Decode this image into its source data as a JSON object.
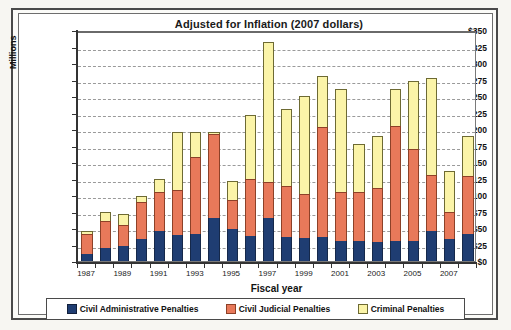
{
  "chart_data": {
    "type": "bar",
    "stacked": true,
    "title": "Adjusted for Inflation  (2007 dollars)",
    "xlabel": "Fiscal year",
    "ylabel": "Millions",
    "ylim": [
      0,
      350
    ],
    "ytick_step": 25,
    "ytick_labels": [
      "$0",
      "$25",
      "$50",
      "$75",
      "$100",
      "$125",
      "$150",
      "$175",
      "$200",
      "$225",
      "$250",
      "$275",
      "$300",
      "$325",
      "$350"
    ],
    "grid": true,
    "legend_position": "bottom",
    "categories": [
      "1987",
      "1988",
      "1989",
      "1990",
      "1991",
      "1992",
      "1993",
      "1994",
      "1995",
      "1996",
      "1997",
      "1998",
      "1999",
      "2000",
      "2001",
      "2002",
      "2003",
      "2004",
      "2005",
      "2006",
      "2007",
      "2008"
    ],
    "xtick_labels": [
      "1987",
      "1989",
      "1991",
      "1993",
      "1995",
      "1997",
      "1999",
      "2001",
      "2003",
      "2005",
      "2007"
    ],
    "series": [
      {
        "name": "Civil Administrative Penalties",
        "color": "#1f3d72",
        "values": [
          11,
          20,
          22,
          33,
          46,
          39,
          41,
          65,
          48,
          38,
          65,
          36,
          35,
          37,
          30,
          31,
          29,
          31,
          31,
          46,
          34,
          41
        ]
      },
      {
        "name": "Civil Judicial Penalties",
        "color": "#e8795a",
        "values": [
          30,
          40,
          32,
          57,
          58,
          69,
          116,
          128,
          44,
          86,
          55,
          78,
          67,
          166,
          74,
          73,
          81,
          174,
          138,
          84,
          41,
          88
        ]
      },
      {
        "name": "Criminal Penalties",
        "color": "#fbf4a8",
        "values": [
          4,
          14,
          18,
          9,
          21,
          88,
          39,
          3,
          30,
          97,
          212,
          117,
          148,
          77,
          156,
          74,
          80,
          55,
          104,
          147,
          61,
          60
        ]
      }
    ],
    "totals": [
      45,
      74,
      72,
      99,
      125,
      196,
      196,
      196,
      122,
      221,
      332,
      231,
      250,
      280,
      260,
      178,
      190,
      260,
      273,
      277,
      136,
      189
    ]
  },
  "legend": {
    "items": [
      {
        "label": "Civil Administrative Penalties",
        "swatch": "s0"
      },
      {
        "label": "Civil Judicial Penalties",
        "swatch": "s1"
      },
      {
        "label": "Criminal Penalties",
        "swatch": "s2"
      }
    ]
  }
}
